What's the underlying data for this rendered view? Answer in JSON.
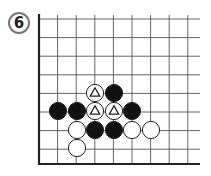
{
  "problem": {
    "number": "6"
  },
  "board": {
    "origin_x": 39,
    "origin_y": 19,
    "spacing": 18.6,
    "cols": 9,
    "rows": 8,
    "edges": [
      "left",
      "bottom"
    ],
    "line_color": "#555555",
    "edge_color": "#222222"
  },
  "stones": [
    {
      "color": "white",
      "col": 3,
      "row": 4,
      "marker": "triangle"
    },
    {
      "color": "black",
      "col": 4,
      "row": 4
    },
    {
      "color": "black",
      "col": 0.5,
      "row": 5
    },
    {
      "color": "black",
      "col": 1.5,
      "row": 5
    },
    {
      "color": "white",
      "col": 3,
      "row": 5,
      "marker": "triangle"
    },
    {
      "color": "white",
      "col": 4,
      "row": 5,
      "marker": "triangle"
    },
    {
      "color": "black",
      "col": 5,
      "row": 5
    },
    {
      "color": "white",
      "col": 1.5,
      "row": 6
    },
    {
      "color": "black",
      "col": 2.5,
      "row": 6
    },
    {
      "color": "black",
      "col": 3.5,
      "row": 6
    },
    {
      "color": "white",
      "col": 4.5,
      "row": 6
    },
    {
      "color": "white",
      "col": 5.5,
      "row": 6
    },
    {
      "color": "white",
      "col": 1.5,
      "row": 7
    }
  ]
}
